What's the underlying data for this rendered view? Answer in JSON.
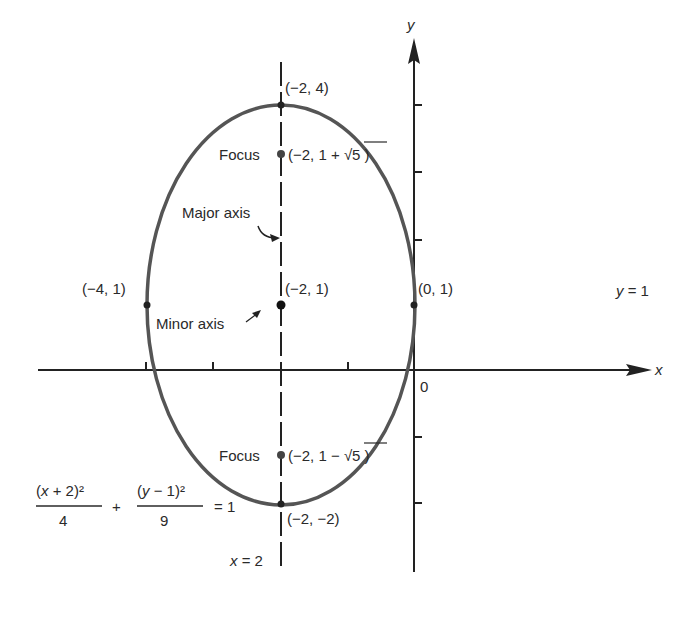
{
  "diagram": {
    "type": "ellipse-graph",
    "axes": {
      "x_label": "x",
      "y_label": "y",
      "origin_label": "0",
      "unit_px": 67,
      "origin_px": [
        414,
        370
      ],
      "x_ticks": [
        -4,
        -3,
        -2,
        -1
      ],
      "y_ticks": [
        -2,
        -1,
        1,
        2,
        3,
        4
      ]
    },
    "ellipse": {
      "center": [
        -2,
        1
      ],
      "a": 3,
      "b": 2,
      "color": "#555555"
    },
    "equation": {
      "num1": "(x + 2)²",
      "den1": "4",
      "plus": "+",
      "num2": "(y − 1)²",
      "den2": "9",
      "rhs": "= 1"
    },
    "lines": {
      "horizontal": "y = 1",
      "vertical": "x = 2"
    },
    "points": {
      "top_vertex": "(−2, 4)",
      "bottom_vertex": "(−2, −2)",
      "center": "(−2, 1)",
      "left_vertex": "(−4, 1)",
      "right_vertex": "(0, 1)",
      "focus_top_prefix": "(−2, 1 + ",
      "focus_bottom_prefix": "(−2, 1 − ",
      "sqrt_arg": "5",
      "close_paren": ")"
    },
    "annotations": {
      "focus_top": "Focus",
      "focus_bottom": "Focus",
      "major_axis": "Major axis",
      "minor_axis": "Minor axis"
    }
  }
}
